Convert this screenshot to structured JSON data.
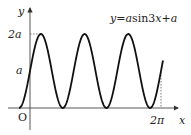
{
  "chart_data": {
    "type": "line",
    "title": "",
    "equation": "y=asin3x+a",
    "xlabel": "x",
    "ylabel": "y",
    "origin_label": "O",
    "x_ticks": [
      "2π"
    ],
    "y_ticks": [
      "a",
      "2a"
    ],
    "series": [
      {
        "name": "y=asin3x+a",
        "function": "a*sin(3x)+a",
        "domain": [
          "-π/6",
          "2π+"
        ],
        "min": 0,
        "max": "2a",
        "period": "2π/3"
      }
    ],
    "grid": false,
    "annotations": [
      "dashed line from y-axis to first peak at 2a",
      "dashed vertical line at x=2π"
    ]
  },
  "labels": {
    "y_axis": "y",
    "x_axis": "x",
    "origin": "O",
    "tick_2a": "2a",
    "tick_a": "a",
    "tick_2pi": "2π",
    "equation_prefix": "y=",
    "equation_a1": "a",
    "equation_mid": "sin3",
    "equation_x": "x",
    "equation_plus": "+",
    "equation_a2": "a"
  }
}
